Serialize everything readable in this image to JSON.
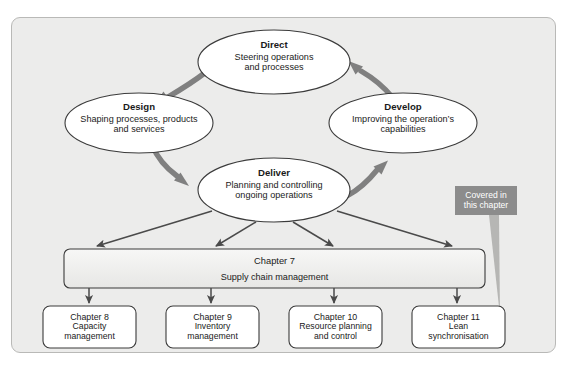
{
  "figure": {
    "background_color": "#ececeb",
    "frame_border_color": "#b9b9b7",
    "node_fill_color": "#ffffff",
    "node_stroke_color": "#3d3d3d",
    "cycle_arrow_color": "#7f7f7f",
    "thin_arrow_color": "#4a4a4a",
    "callout_color": "#8c8c8c"
  },
  "ellipses": [
    {
      "id": "direct",
      "title": "Direct",
      "line1": "Steering operations",
      "line2": "and processes"
    },
    {
      "id": "design",
      "title": "Design",
      "line1": "Shaping processes, products",
      "line2": "and services"
    },
    {
      "id": "develop",
      "title": "Develop",
      "line1": "Improving the operation’s",
      "line2": "capabilities"
    },
    {
      "id": "deliver",
      "title": "Deliver",
      "line1": "Planning and controlling",
      "line2": "ongoing operations"
    }
  ],
  "bar": {
    "id": "chapter-7",
    "title": "Chapter 7",
    "subtitle": "Supply chain management"
  },
  "boxes": [
    {
      "id": "chapter-8",
      "title": "Chapter 8",
      "line1": "Capacity",
      "line2": "management"
    },
    {
      "id": "chapter-9",
      "title": "Chapter 9",
      "line1": "Inventory",
      "line2": "management"
    },
    {
      "id": "chapter-10",
      "title": "Chapter 10",
      "line1": "Resource planning",
      "line2": "and control"
    },
    {
      "id": "chapter-11",
      "title": "Chapter 11",
      "line1": "Lean",
      "line2": "synchronisation"
    }
  ],
  "callout": {
    "line1": "Covered in",
    "line2": "this chapter"
  }
}
